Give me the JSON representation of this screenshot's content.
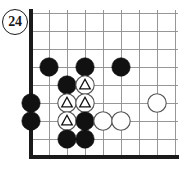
{
  "diagram": {
    "type": "go-board-problem-diagram",
    "move_label": "24",
    "board": {
      "origin_x": 31,
      "origin_y": 13,
      "spacing": 18,
      "cols": 9,
      "rows": 9,
      "grid_color": "#8c8c8c",
      "edge_color": "#1a1a1a",
      "edge_width": 3.2,
      "grid_width": 0.9,
      "background": "#ffffff",
      "left_edge": true,
      "bottom_edge": true,
      "top_edge": false,
      "right_edge": false
    },
    "stone": {
      "radius": 9.2,
      "black_fill": "#111111",
      "white_fill": "#ffffff",
      "white_stroke": "#555555",
      "black_stroke": "#111111",
      "mark_color": "#111111"
    },
    "stones": [
      {
        "col": 1,
        "row": 3,
        "color": "black",
        "mark": "none"
      },
      {
        "col": 3,
        "row": 3,
        "color": "black",
        "mark": "none"
      },
      {
        "col": 5,
        "row": 3,
        "color": "black",
        "mark": "none"
      },
      {
        "col": 2,
        "row": 4,
        "color": "black",
        "mark": "none"
      },
      {
        "col": 3,
        "row": 4,
        "color": "white",
        "mark": "triangle"
      },
      {
        "col": 0,
        "row": 5,
        "color": "black",
        "mark": "none"
      },
      {
        "col": 2,
        "row": 5,
        "color": "white",
        "mark": "triangle"
      },
      {
        "col": 3,
        "row": 5,
        "color": "white",
        "mark": "triangle"
      },
      {
        "col": 7,
        "row": 5,
        "color": "white",
        "mark": "none"
      },
      {
        "col": 0,
        "row": 6,
        "color": "black",
        "mark": "none"
      },
      {
        "col": 2,
        "row": 6,
        "color": "white",
        "mark": "triangle"
      },
      {
        "col": 3,
        "row": 6,
        "color": "black",
        "mark": "none"
      },
      {
        "col": 4,
        "row": 6,
        "color": "white",
        "mark": "none"
      },
      {
        "col": 5,
        "row": 6,
        "color": "white",
        "mark": "none"
      },
      {
        "col": 2,
        "row": 7,
        "color": "black",
        "mark": "none"
      },
      {
        "col": 3,
        "row": 7,
        "color": "black",
        "mark": "none"
      }
    ]
  }
}
